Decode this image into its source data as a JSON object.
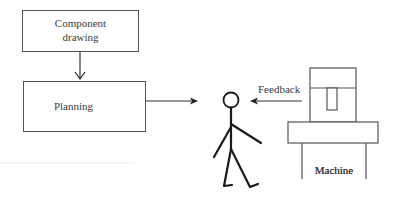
{
  "diagram": {
    "nodes": {
      "component_drawing": {
        "line1": "Component",
        "line2": "drawing"
      },
      "planning": {
        "label": "Planning"
      },
      "person": {
        "label": ""
      },
      "machine": {
        "label": "Machine"
      }
    },
    "edges": [
      {
        "from": "component_drawing",
        "to": "planning",
        "label": ""
      },
      {
        "from": "planning",
        "to": "person",
        "label": ""
      },
      {
        "from": "machine",
        "to": "person",
        "label": "Feedback"
      }
    ],
    "feedback_label": "Feedback"
  },
  "colors": {
    "line": "#555555",
    "figure": "#1a1a1a",
    "text": "#3a3a3a"
  }
}
